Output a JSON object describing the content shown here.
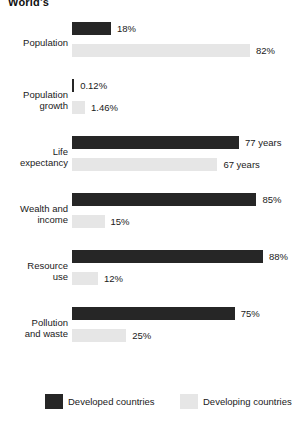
{
  "title": "World's",
  "colors": {
    "developed": "#262626",
    "developing": "#e6e6e6",
    "text": "#1a1a1a",
    "background": "#ffffff"
  },
  "legend": {
    "developed_label": "Developed countries",
    "developing_label": "Developing countries"
  },
  "chart_data": {
    "type": "bar",
    "orientation": "horizontal",
    "title": "World's",
    "xlabel": "",
    "ylabel": "",
    "xlim": [
      0,
      100
    ],
    "grid": false,
    "legend_position": "bottom",
    "categories": [
      "Population",
      "Population growth",
      "Life expectancy",
      "Wealth and income",
      "Resource use",
      "Pollution and waste"
    ],
    "series": [
      {
        "name": "Developed countries",
        "color": "#262626",
        "values": [
          18,
          0.12,
          77,
          85,
          88,
          75
        ],
        "labels": [
          "18%",
          "0.12%",
          "77 years",
          "85%",
          "88%",
          "75%"
        ]
      },
      {
        "name": "Developing countries",
        "color": "#e6e6e6",
        "values": [
          82,
          1.46,
          67,
          15,
          12,
          25
        ],
        "labels": [
          "82%",
          "1.46%",
          "67 years",
          "15%",
          "12%",
          "25%"
        ]
      }
    ]
  },
  "groups": [
    {
      "label_line1": "Population",
      "label_line2": "",
      "developed": {
        "label": "18%",
        "width_pct": 18
      },
      "developing": {
        "label": "82%",
        "width_pct": 82
      }
    },
    {
      "label_line1": "Population",
      "label_line2": "growth",
      "developed": {
        "label": "0.12%",
        "width_pct": 1
      },
      "developing": {
        "label": "1.46%",
        "width_pct": 6
      }
    },
    {
      "label_line1": "Life",
      "label_line2": "expectancy",
      "developed": {
        "label": "77 years",
        "width_pct": 77
      },
      "developing": {
        "label": "67 years",
        "width_pct": 67
      }
    },
    {
      "label_line1": "Wealth and",
      "label_line2": "income",
      "developed": {
        "label": "85%",
        "width_pct": 85
      },
      "developing": {
        "label": "15%",
        "width_pct": 15
      }
    },
    {
      "label_line1": "Resource",
      "label_line2": "use",
      "developed": {
        "label": "88%",
        "width_pct": 88
      },
      "developing": {
        "label": "12%",
        "width_pct": 12
      }
    },
    {
      "label_line1": "Pollution",
      "label_line2": "and waste",
      "developed": {
        "label": "75%",
        "width_pct": 75
      },
      "developing": {
        "label": "25%",
        "width_pct": 25
      }
    }
  ]
}
